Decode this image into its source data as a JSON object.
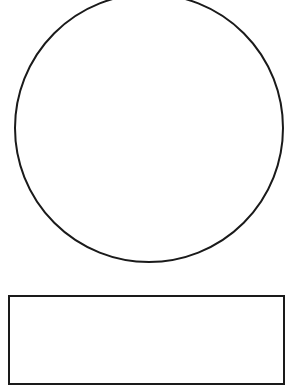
{
  "diagram": {
    "background": "#ffffff",
    "stroke_color": "#1a1a1a",
    "shapes": [
      {
        "type": "circle",
        "name": "large-circle",
        "cx": 148.5,
        "cy": 128,
        "r": 135,
        "stroke_width": 2,
        "fill": "none"
      },
      {
        "type": "rectangle",
        "name": "rectangle",
        "x": 8,
        "y": 295,
        "width": 277,
        "height": 90,
        "stroke_width": 2,
        "fill": "none",
        "note": "extends past bottom edge"
      }
    ]
  }
}
